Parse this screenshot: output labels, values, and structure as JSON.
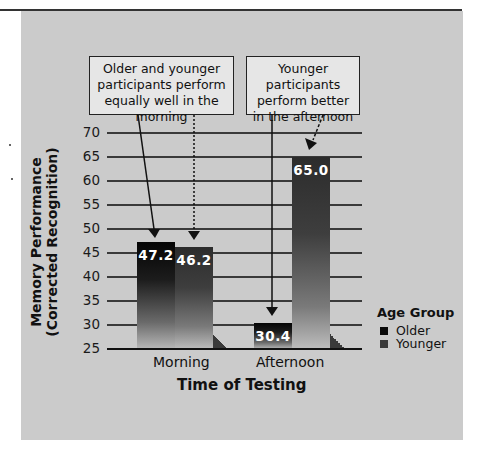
{
  "chart_data": {
    "type": "bar",
    "title": "",
    "xlabel": "Time of Testing",
    "ylabel": [
      "Memory Performance",
      "(Corrected Recognition)"
    ],
    "categories": [
      "Morning",
      "Afternoon"
    ],
    "series": [
      {
        "name": "Older",
        "values": [
          47.2,
          30.4
        ],
        "color": "#0a0a0a"
      },
      {
        "name": "Younger",
        "values": [
          46.2,
          65.0
        ],
        "color": "#3a3a3a"
      }
    ],
    "data_labels": {
      "older_morning": "47.2",
      "younger_morning": "46.2",
      "older_afternoon": "30.4",
      "younger_afternoon": "65.0"
    },
    "ylim": [
      25,
      70
    ],
    "yticks": [
      "70",
      "65",
      "60",
      "55",
      "50",
      "45",
      "40",
      "35",
      "30",
      "25"
    ],
    "grid": true,
    "legend": {
      "title": "Age Group",
      "position": "right",
      "entries": [
        "Older",
        "Younger"
      ]
    },
    "annotations": [
      {
        "lines": [
          "Older and younger",
          "participants perform",
          "equally well in the morning"
        ],
        "target": "Morning"
      },
      {
        "lines": [
          "Younger participants",
          "perform better",
          "in the afternoon"
        ],
        "target": "Afternoon"
      }
    ]
  },
  "colors": {
    "panel": "#cbcbcb",
    "callout_fill": "#e6e6e6",
    "older": "#0a0a0a",
    "younger": "#3a3a3a"
  }
}
